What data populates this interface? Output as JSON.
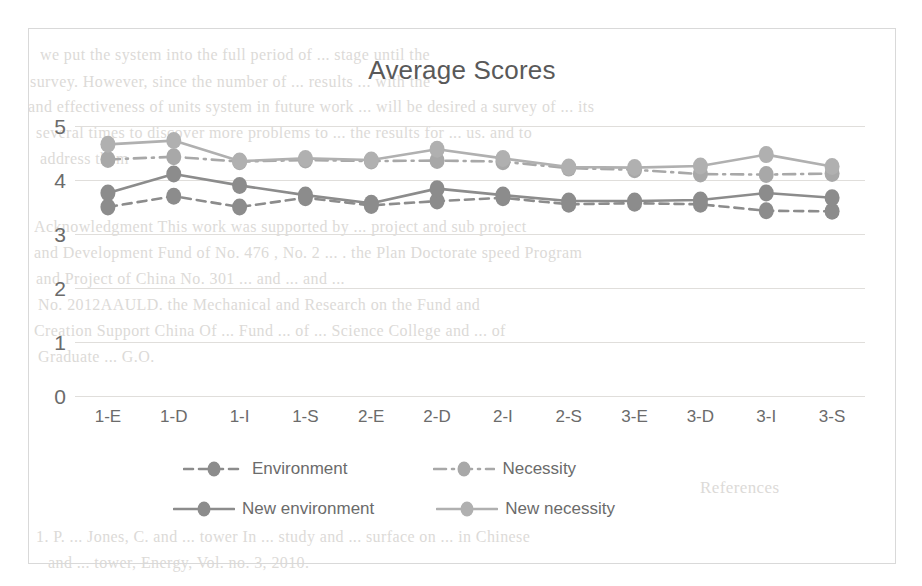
{
  "chart_data": {
    "type": "line",
    "title": "Average Scores",
    "xlabel": "",
    "ylabel": "",
    "ylim": [
      0,
      5
    ],
    "yticks": [
      0,
      1,
      2,
      3,
      4,
      5
    ],
    "grid": true,
    "legend_position": "bottom",
    "categories": [
      "1-E",
      "1-D",
      "1-I",
      "1-S",
      "2-E",
      "2-D",
      "2-I",
      "2-S",
      "3-E",
      "3-D",
      "3-I",
      "3-S"
    ],
    "series": [
      {
        "name": "Environment",
        "style": "dashed",
        "color": "#8c8c8c",
        "values": [
          3.5,
          3.7,
          3.5,
          3.67,
          3.53,
          3.61,
          3.67,
          3.55,
          3.57,
          3.55,
          3.43,
          3.42
        ]
      },
      {
        "name": "Necessity",
        "style": "dash-dot",
        "color": "#a8a8a8",
        "values": [
          4.38,
          4.43,
          4.34,
          4.37,
          4.35,
          4.36,
          4.34,
          4.22,
          4.19,
          4.11,
          4.1,
          4.12
        ]
      },
      {
        "name": "New environment",
        "style": "solid",
        "color": "#8c8c8c",
        "values": [
          3.76,
          4.11,
          3.9,
          3.72,
          3.57,
          3.84,
          3.72,
          3.61,
          3.61,
          3.63,
          3.76,
          3.67
        ]
      },
      {
        "name": "New necessity",
        "style": "solid",
        "color": "#b0b0b0",
        "values": [
          4.66,
          4.73,
          4.35,
          4.4,
          4.37,
          4.57,
          4.4,
          4.24,
          4.23,
          4.26,
          4.47,
          4.25
        ]
      }
    ]
  },
  "chart": {
    "title": "Average Scores",
    "ytick_labels": [
      "5",
      "4",
      "3",
      "2",
      "1",
      "0"
    ],
    "xtick_labels": [
      "1-E",
      "1-D",
      "1-I",
      "1-S",
      "2-E",
      "2-D",
      "2-I",
      "2-S",
      "3-E",
      "3-D",
      "3-I",
      "3-S"
    ]
  },
  "legend": {
    "items": [
      {
        "label": "Environment",
        "style": "dashed",
        "color": "#8c8c8c"
      },
      {
        "label": "Necessity",
        "style": "dash-dot",
        "color": "#a8a8a8"
      },
      {
        "label": "New environment",
        "style": "solid",
        "color": "#8c8c8c"
      },
      {
        "label": "New necessity",
        "style": "solid",
        "color": "#b0b0b0"
      }
    ]
  },
  "background_text": {
    "lines": [
      {
        "text": "we put the system into the full period of ... stage until the",
        "x": 40,
        "y": 46,
        "size": 16
      },
      {
        "text": "survey. However, since the number of ... results ... with the",
        "x": 30,
        "y": 73,
        "size": 16
      },
      {
        "text": "and effectiveness of units system in future work ... will be desired a survey of ... its",
        "x": 28,
        "y": 98,
        "size": 16
      },
      {
        "text": "several times to discover more problems to ... the results for  ... us. and to",
        "x": 36,
        "y": 124,
        "size": 16
      },
      {
        "text": "address them",
        "x": 40,
        "y": 150,
        "size": 16
      },
      {
        "text": "Acknowledgment  This work was supported by ... project and sub project",
        "x": 34,
        "y": 218,
        "size": 16
      },
      {
        "text": "and Development Fund of No. 476 , No. 2 ... . the Plan Doctorate speed Program",
        "x": 34,
        "y": 244,
        "size": 16
      },
      {
        "text": "and Project of China No. 301 ... and ... and ...",
        "x": 36,
        "y": 270,
        "size": 16
      },
      {
        "text": "No. 2012AAULD. the  Mechanical  and  Research  on  the  Fund  and",
        "x": 38,
        "y": 296,
        "size": 16
      },
      {
        "text": "Creation Support  China  Of ... Fund  ... of  ... Science  College  and  ... of",
        "x": 34,
        "y": 322,
        "size": 16
      },
      {
        "text": "Graduate ... G.O.",
        "x": 38,
        "y": 348,
        "size": 16
      },
      {
        "text": "References",
        "x": 700,
        "y": 478,
        "size": 17
      },
      {
        "text": "1.  P. ... Jones, C. and ... tower  In ... study  and  ... surface on  ... in  Chinese",
        "x": 36,
        "y": 528,
        "size": 16
      },
      {
        "text": "and  ...  tower,  Energy,  Vol.  no. 3, 2010.",
        "x": 48,
        "y": 554,
        "size": 16
      }
    ]
  }
}
